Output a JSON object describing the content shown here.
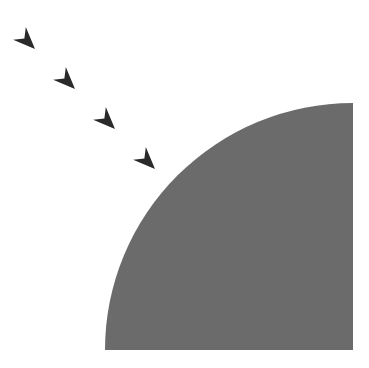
{
  "canvas": {
    "width": 369,
    "height": 368,
    "background": "#ffffff"
  },
  "shape": {
    "type": "quarter-circle",
    "fill": "#6b6b6b",
    "corner": [
      353,
      350
    ],
    "radius_x": 248,
    "radius_y": 247
  },
  "arrows": {
    "color": "#2a2a2a",
    "direction_deg": 45,
    "items": [
      {
        "tip": [
          35,
          49
        ]
      },
      {
        "tip": [
          75,
          89
        ]
      },
      {
        "tip": [
          115,
          129
        ]
      },
      {
        "tip": [
          155,
          169
        ]
      }
    ]
  }
}
